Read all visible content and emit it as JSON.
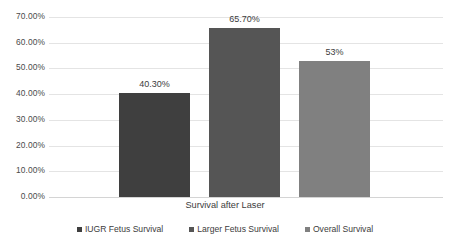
{
  "chart_data": {
    "type": "bar",
    "title": "",
    "xlabel": "",
    "ylabel": "",
    "categories": [
      "Survival after Laser"
    ],
    "category_label": "Survival after Laser",
    "series": [
      {
        "name": "IUGR Fetus Survival",
        "values": [
          40.3
        ],
        "label": "40.30%",
        "color": "#3f3f3f"
      },
      {
        "name": "Larger Fetus Survival",
        "values": [
          65.7
        ],
        "label": "65.70%",
        "color": "#555555"
      },
      {
        "name": "Overall Survival",
        "values": [
          53.0
        ],
        "label": "53%",
        "color": "#808080"
      }
    ],
    "ylim": [
      0,
      70
    ],
    "ytick_values": [
      0,
      10,
      20,
      30,
      40,
      50,
      60,
      70
    ],
    "ytick_labels": [
      "0.00%",
      "10.00%",
      "20.00%",
      "30.00%",
      "40.00%",
      "50.00%",
      "60.00%",
      "70.00%"
    ],
    "grid": true,
    "legend_position": "bottom",
    "grid_color": "#e4e4e4",
    "background_color": "#ffffff"
  },
  "legend": {
    "items": [
      {
        "label": "IUGR Fetus Survival"
      },
      {
        "label": "Larger Fetus Survival"
      },
      {
        "label": "Overall Survival"
      }
    ]
  }
}
